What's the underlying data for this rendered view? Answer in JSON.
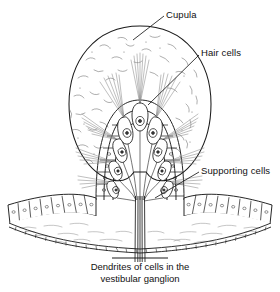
{
  "figure": {
    "type": "anatomical-diagram",
    "background_color": "#ffffff",
    "ink_color": "#1a1a1a",
    "labels": [
      {
        "id": "cupula",
        "text": "Cupula",
        "x": 166,
        "y": 9,
        "leader_from": [
          164,
          16
        ],
        "leader_to": [
          133,
          40
        ]
      },
      {
        "id": "hair_cells",
        "text": "Hair cells",
        "x": 201,
        "y": 47,
        "leader_from": [
          199,
          55
        ],
        "leader_to": [
          148,
          105
        ]
      },
      {
        "id": "supporting_cells",
        "text": "Supporting cells",
        "x": 201,
        "y": 165,
        "leader_from": [
          199,
          172
        ],
        "leader_to": [
          155,
          198
        ]
      }
    ],
    "caption": {
      "line1": "Dendrites of cells in the",
      "line2": "vestibular ganglion"
    },
    "parts": {
      "cupula": "gelatinous dome with stippled texture",
      "crista": "ridge of sensory epithelium",
      "hair_cells": "flask-shaped cells with apical stereocilia bundles",
      "supporting_cells": "columnar cells flanking the crista",
      "basement_membrane": "beaded curved line beneath the epithelium",
      "nerve_fibers": "parallel dendrites descending to the vestibular ganglion"
    }
  }
}
